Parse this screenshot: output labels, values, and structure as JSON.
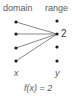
{
  "diagram": {
    "headers": {
      "domain": "domain",
      "range": "range"
    },
    "domain_points": [
      {
        "y": 22
      },
      {
        "y": 34
      },
      {
        "y": 48
      },
      {
        "y": 61
      }
    ],
    "range_points": [
      {
        "y": 21,
        "label": ""
      },
      {
        "y": 34,
        "label": "2"
      },
      {
        "y": 47,
        "label": ""
      },
      {
        "y": 61,
        "label": ""
      }
    ],
    "mapping_target_index": 1,
    "axis_labels": {
      "domain": "x",
      "range": "y"
    },
    "caption": "f(x) = 2",
    "colors": {
      "dot": "#1a1a1a",
      "line": "#6a6a6a",
      "text": "#5a5a5a"
    }
  }
}
